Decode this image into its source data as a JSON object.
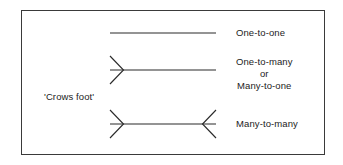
{
  "figure": {
    "notation_name": "'Crows foot'",
    "border_color": "#3a3a3a",
    "line_color": "#2b2b2b",
    "background_color": "#ffffff",
    "text_color": "#1c1c1c"
  },
  "relationships": [
    {
      "id": "one-to-one",
      "label": "One-to-one",
      "left_end": "plain",
      "right_end": "plain",
      "line_y": 33,
      "line_x1": 110,
      "line_x2": 216
    },
    {
      "id": "one-to-many",
      "label_line_1": "One-to-many",
      "label_line_2": "or",
      "label_line_3": "Many-to-one",
      "left_end": "crows-foot",
      "right_end": "plain",
      "line_y": 70,
      "line_x1": 110,
      "line_x2": 216
    },
    {
      "id": "many-to-many",
      "label": "Many-to-many",
      "left_end": "crows-foot",
      "right_end": "crows-foot",
      "line_y": 124,
      "line_x1": 110,
      "line_x2": 216
    }
  ]
}
